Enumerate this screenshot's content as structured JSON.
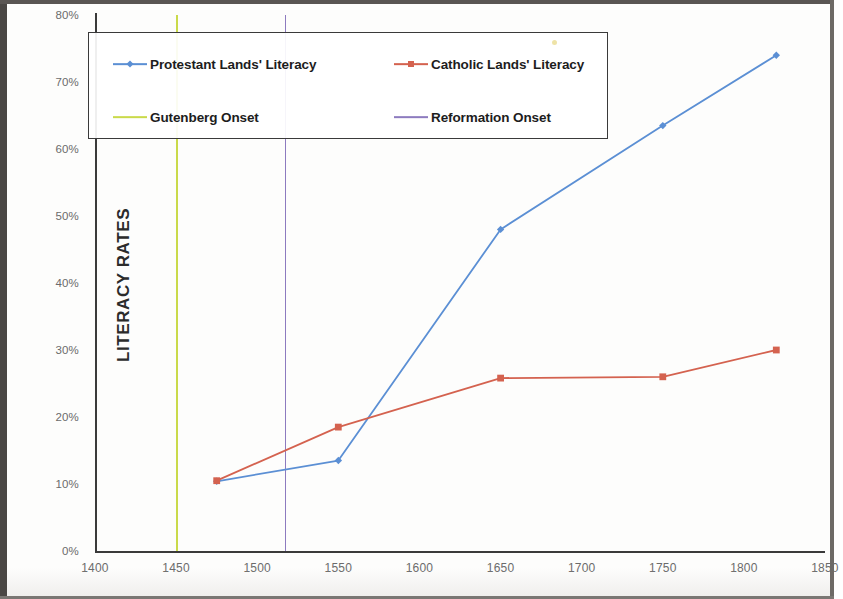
{
  "chart_data": {
    "type": "line",
    "title": "",
    "xlabel": "",
    "ylabel": "LITERACY RATES",
    "xlim": [
      1400,
      1850
    ],
    "ylim": [
      0,
      80
    ],
    "grid": false,
    "legend_position": "top-left-inside",
    "x_ticks": [
      "1400",
      "1450",
      "1500",
      "1550",
      "1600",
      "1650",
      "1700",
      "1750",
      "1800",
      "1850"
    ],
    "y_ticks": [
      "0%",
      "10%",
      "20%",
      "30%",
      "40%",
      "50%",
      "60%",
      "70%",
      "80%"
    ],
    "series": [
      {
        "name": "Protestant Lands' Literacy",
        "color": "#5b8fd4",
        "marker": "diamond",
        "x": [
          1475,
          1550,
          1650,
          1750,
          1820
        ],
        "values": [
          10.4,
          13.5,
          48.0,
          63.5,
          74.0
        ]
      },
      {
        "name": "Catholic Lands' Literacy",
        "color": "#d4624f",
        "marker": "square",
        "x": [
          1475,
          1550,
          1650,
          1750,
          1820
        ],
        "values": [
          10.5,
          18.5,
          25.8,
          26.0,
          30.0
        ]
      }
    ],
    "vertical_markers": [
      {
        "name": "Gutenberg Onset",
        "x": 1450,
        "color": "#cada4a"
      },
      {
        "name": "Reformation Onset",
        "x": 1517,
        "color": "#8d7bbf"
      }
    ]
  },
  "legend": {
    "items": [
      {
        "label": "Protestant Lands' Literacy"
      },
      {
        "label": "Catholic Lands' Literacy"
      },
      {
        "label": "Gutenberg Onset"
      },
      {
        "label": "Reformation Onset"
      }
    ]
  },
  "axis": {
    "y_title": "LITERACY RATES"
  }
}
